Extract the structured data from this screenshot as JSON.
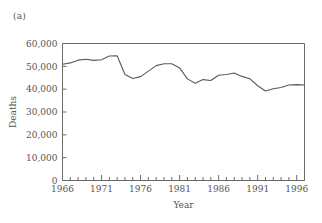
{
  "figure": {
    "panel_label": "(a)"
  },
  "chart_data": {
    "type": "line",
    "title": "",
    "xlabel": "Year",
    "ylabel": "Deaths",
    "xlim": [
      1966,
      1997
    ],
    "ylim": [
      0,
      60000
    ],
    "grid": false,
    "legend": null,
    "x_tick_labels": [
      "1966",
      "1971",
      "1976",
      "1981",
      "1986",
      "1991",
      "1996"
    ],
    "x_major_ticks": [
      1966,
      1971,
      1976,
      1981,
      1986,
      1991,
      1996
    ],
    "x_minor_tick_step": 1,
    "y_tick_labels": [
      "0",
      "10,000",
      "20,000",
      "30,000",
      "40,000",
      "50,000",
      "60,000"
    ],
    "y_ticks": [
      0,
      10000,
      20000,
      30000,
      40000,
      50000,
      60000
    ],
    "line_color": "#5a5a5a",
    "axis_color": "#6b6b6b",
    "x": [
      1966,
      1967,
      1968,
      1969,
      1970,
      1971,
      1972,
      1973,
      1974,
      1975,
      1976,
      1977,
      1978,
      1979,
      1980,
      1981,
      1982,
      1983,
      1984,
      1985,
      1986,
      1987,
      1988,
      1989,
      1990,
      1991,
      1992,
      1993,
      1994,
      1995,
      1996,
      1997
    ],
    "values": [
      50900,
      51500,
      52700,
      53100,
      52600,
      52900,
      54500,
      54600,
      46400,
      44700,
      45500,
      47900,
      50300,
      51100,
      51100,
      49300,
      44500,
      42600,
      44200,
      43800,
      46100,
      46400,
      47100,
      45600,
      44600,
      41500,
      39200,
      40200,
      40700,
      41800,
      42000,
      41800
    ],
    "annotations": []
  }
}
